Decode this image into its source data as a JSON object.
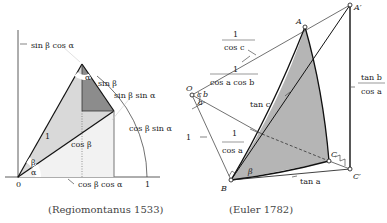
{
  "left_figure": {
    "caption": "(Regiomontanus 1533)",
    "labels": {
      "sin_b_cos_a": "sin β cos α",
      "alpha_top": "α",
      "sin_b": "sin β",
      "sin_b_sin_a": "sin β sin α",
      "one_hyp": "1",
      "cos_b": "cos β",
      "cos_b_sin_a": "cos β sin α",
      "beta": "β",
      "alpha": "α",
      "origin": "0",
      "cos_b_cos_a": "cos β cos α",
      "one_axis": "1"
    }
  },
  "right_figure": {
    "caption": "(Euler 1782)",
    "points": {
      "O": "O",
      "A": "A",
      "A_prime": "A′",
      "B": "B",
      "C": "C",
      "C_prime": "C′"
    },
    "labels": {
      "one_over_cos_c_num": "1",
      "one_over_cos_c_den": "cos c",
      "one_over_cosacosb_num": "1",
      "one_over_cosacosb_den": "cos a cos b",
      "tan_c": "tan c",
      "tan_b_over_cos_a_num": "tan b",
      "tan_b_over_cos_a_den": "cos a",
      "angle_c": "c",
      "angle_b": "b",
      "angle_a": "a",
      "one": "1",
      "one_over_cos_a_num": "1",
      "one_over_cos_a_den": "cos a",
      "tan_a": "tan a",
      "beta": "β"
    }
  },
  "colors": {
    "light_fill": "#d6d6d6",
    "dark_fill": "#8c8c8c",
    "line": "#1a1a1a",
    "euler_dark": "#7a7a7a",
    "euler_light": "#a8a8a8"
  }
}
